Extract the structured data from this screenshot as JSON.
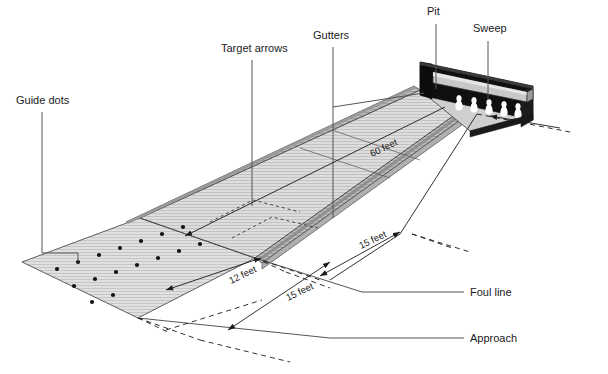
{
  "figure": {
    "background_color": "#ffffff"
  },
  "callouts": [
    {
      "id": "guide-dots",
      "label": "Guide dots",
      "x": 16,
      "y": 104
    },
    {
      "id": "target-arrows",
      "label": "Target arrows",
      "x": 221,
      "y": 52
    },
    {
      "id": "gutters",
      "label": "Gutters",
      "x": 313,
      "y": 39
    },
    {
      "id": "pit",
      "label": "Pit",
      "x": 427,
      "y": 15
    },
    {
      "id": "sweep",
      "label": "Sweep",
      "x": 473,
      "y": 32
    },
    {
      "id": "foul-line",
      "label": "Foul line",
      "x": 470,
      "y": 296
    },
    {
      "id": "approach",
      "label": "Approach",
      "x": 470,
      "y": 342
    }
  ],
  "dimensions": [
    {
      "id": "lane-length",
      "label": "60 feet",
      "x": 372,
      "y": 157,
      "rotate": -26
    },
    {
      "id": "approach-length",
      "label": "12 feet",
      "x": 231,
      "y": 284,
      "rotate": -26
    },
    {
      "id": "approach-depth",
      "label": "15 feet",
      "x": 288,
      "y": 301,
      "rotate": -26
    },
    {
      "id": "foul-to-arrows",
      "label": "15 feet",
      "x": 361,
      "y": 249,
      "rotate": -26
    }
  ],
  "colors": {
    "lane_surface": "#d9d9d9",
    "approach_surface": "#dcdcdc",
    "gutter_fill": "#b4b4b4",
    "pit_dark": "#101010",
    "sweep_bar": "#c8c8c8",
    "pin_white": "#ffffff",
    "line_dark": "#1a1a1a",
    "leader_gray": "#555555"
  },
  "elements": {
    "pins_count": 5,
    "guide_dot_rows": 2,
    "target_arrow_count": 7,
    "lane_texture": "fine-hatch"
  }
}
